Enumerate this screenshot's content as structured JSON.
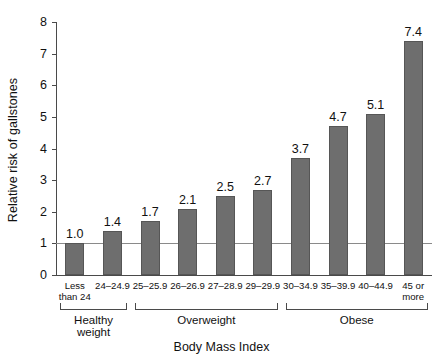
{
  "chart_data": {
    "type": "bar",
    "title": "",
    "xlabel": "Body Mass Index",
    "ylabel": "Relative risk of gallstones",
    "categories": [
      "Less than 24",
      "24–24.9",
      "25–25.9",
      "26–26.9",
      "27–28.9",
      "29–29.9",
      "30–34.9",
      "35–39.9",
      "40–44.9",
      "45 or more"
    ],
    "category_lines": [
      [
        "Less",
        "than 24"
      ],
      [
        "24–24.9"
      ],
      [
        "25–25.9"
      ],
      [
        "26–26.9"
      ],
      [
        "27–28.9"
      ],
      [
        "29–29.9"
      ],
      [
        "30–34.9"
      ],
      [
        "35–39.9"
      ],
      [
        "40–44.9"
      ],
      [
        "45 or",
        "more"
      ]
    ],
    "values": [
      1.0,
      1.4,
      1.7,
      2.1,
      2.5,
      2.7,
      3.7,
      4.7,
      5.1,
      7.4
    ],
    "value_labels": [
      "1.0",
      "1.4",
      "1.7",
      "2.1",
      "2.5",
      "2.7",
      "3.7",
      "4.7",
      "5.1",
      "7.4"
    ],
    "ylim": [
      0,
      8
    ],
    "ytick_labels": [
      "0",
      "1",
      "2",
      "3",
      "4",
      "5",
      "6",
      "7",
      "8"
    ],
    "yticks": [
      0,
      1,
      2,
      3,
      4,
      5,
      6,
      7,
      8
    ],
    "grid": false,
    "legend": "none",
    "reference_line": {
      "value": 1,
      "label": ""
    },
    "bar_color": "#6e6e6e",
    "axis_color": "#4a4a4a",
    "groups": [
      {
        "label": "Healthy weight",
        "start_index": 0,
        "end_index": 1
      },
      {
        "label": "Overweight",
        "start_index": 2,
        "end_index": 5
      },
      {
        "label": "Obese",
        "start_index": 6,
        "end_index": 9
      }
    ]
  }
}
